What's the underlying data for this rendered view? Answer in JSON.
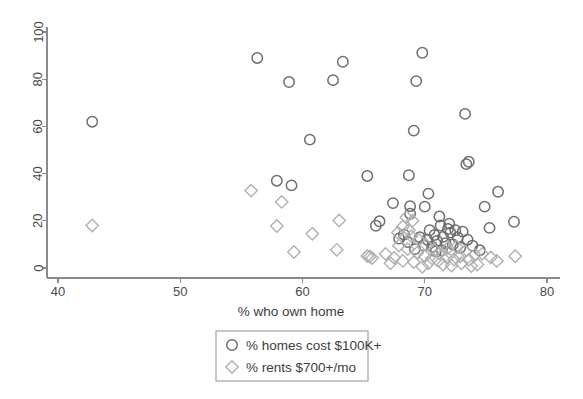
{
  "chart_data": {
    "type": "scatter",
    "title": "",
    "xlabel": "% who own home",
    "ylabel": "",
    "xlim": [
      40,
      80
    ],
    "ylim": [
      0,
      100
    ],
    "xticks": [
      40,
      50,
      60,
      70,
      80
    ],
    "yticks": [
      0,
      20,
      40,
      60,
      80,
      100
    ],
    "grid": false,
    "legend_position": "below-axis-center",
    "series": [
      {
        "name": "% homes cost $100K+",
        "marker": "circle",
        "color": "#6e6e6e",
        "points": [
          [
            42.8,
            62.0
          ],
          [
            56.3,
            89.0
          ],
          [
            58.9,
            78.8
          ],
          [
            62.5,
            79.6
          ],
          [
            63.3,
            87.4
          ],
          [
            69.8,
            91.2
          ],
          [
            69.3,
            79.2
          ],
          [
            73.3,
            65.3
          ],
          [
            69.1,
            58.2
          ],
          [
            60.6,
            54.4
          ],
          [
            73.6,
            45.0
          ],
          [
            73.4,
            44.0
          ],
          [
            65.3,
            39.0
          ],
          [
            68.7,
            39.3
          ],
          [
            57.9,
            37.0
          ],
          [
            59.1,
            35.0
          ],
          [
            70.3,
            31.5
          ],
          [
            76.0,
            32.3
          ],
          [
            67.4,
            27.5
          ],
          [
            68.8,
            26.2
          ],
          [
            70.0,
            26.0
          ],
          [
            68.8,
            23.0
          ],
          [
            74.9,
            26.0
          ],
          [
            66.3,
            19.8
          ],
          [
            66.0,
            17.9
          ],
          [
            77.3,
            19.6
          ],
          [
            71.2,
            21.8
          ],
          [
            75.3,
            17.0
          ],
          [
            71.9,
            16.5
          ],
          [
            72.5,
            16.0
          ],
          [
            72.1,
            15.0
          ],
          [
            73.1,
            15.4
          ],
          [
            70.8,
            14.0
          ],
          [
            71.5,
            13.2
          ],
          [
            72.7,
            13.0
          ],
          [
            69.6,
            13.0
          ],
          [
            70.2,
            12.0
          ],
          [
            71.0,
            11.5
          ],
          [
            68.6,
            11.0
          ],
          [
            71.7,
            10.5
          ],
          [
            72.3,
            10.0
          ],
          [
            69.9,
            9.6
          ],
          [
            70.6,
            9.0
          ],
          [
            73.5,
            12.0
          ],
          [
            68.3,
            14.2
          ],
          [
            69.2,
            8.0
          ],
          [
            71.4,
            7.5
          ],
          [
            72.9,
            8.6
          ],
          [
            70.9,
            7.0
          ],
          [
            74.5,
            7.5
          ],
          [
            73.9,
            9.5
          ],
          [
            67.9,
            12.5
          ],
          [
            70.4,
            16.0
          ],
          [
            72.0,
            18.8
          ],
          [
            71.3,
            18.0
          ]
        ]
      },
      {
        "name": "% rents $700+/mo",
        "marker": "diamond",
        "color": "#b0b0b0",
        "points": [
          [
            42.8,
            18.0
          ],
          [
            55.8,
            32.8
          ],
          [
            58.3,
            28.0
          ],
          [
            57.9,
            17.8
          ],
          [
            59.3,
            6.8
          ],
          [
            60.8,
            14.5
          ],
          [
            62.8,
            7.7
          ],
          [
            63.0,
            20.1
          ],
          [
            65.3,
            5.1
          ],
          [
            65.7,
            4.2
          ],
          [
            65.5,
            4.8
          ],
          [
            67.5,
            4.3
          ],
          [
            68.2,
            3.0
          ],
          [
            68.5,
            21.5
          ],
          [
            69.0,
            20.0
          ],
          [
            68.2,
            17.5
          ],
          [
            68.7,
            16.0
          ],
          [
            67.8,
            15.0
          ],
          [
            68.9,
            13.5
          ],
          [
            69.5,
            12.0
          ],
          [
            67.9,
            9.5
          ],
          [
            68.6,
            8.0
          ],
          [
            69.4,
            6.5
          ],
          [
            70.0,
            5.0
          ],
          [
            70.6,
            4.0
          ],
          [
            69.1,
            2.5
          ],
          [
            70.3,
            2.0
          ],
          [
            71.1,
            3.0
          ],
          [
            71.8,
            4.5
          ],
          [
            72.4,
            3.5
          ],
          [
            72.9,
            5.0
          ],
          [
            71.5,
            1.5
          ],
          [
            72.2,
            1.0
          ],
          [
            73.0,
            2.0
          ],
          [
            73.6,
            3.5
          ],
          [
            74.1,
            5.5
          ],
          [
            73.3,
            7.0
          ],
          [
            74.7,
            6.0
          ],
          [
            75.4,
            4.5
          ],
          [
            75.9,
            3.0
          ],
          [
            77.4,
            5.0
          ],
          [
            70.8,
            7.5
          ],
          [
            71.9,
            8.5
          ],
          [
            72.6,
            9.0
          ],
          [
            73.8,
            0.8
          ],
          [
            74.3,
            1.5
          ],
          [
            66.8,
            6.0
          ],
          [
            69.8,
            0.5
          ],
          [
            67.2,
            2.0
          ],
          [
            71.2,
            6.2
          ],
          [
            72.0,
            6.8
          ],
          [
            70.1,
            9.8
          ]
        ]
      }
    ]
  },
  "legend": {
    "entries": [
      {
        "label": "% homes cost $100K+",
        "marker": "circle"
      },
      {
        "label": "% rents $700+/mo",
        "marker": "diamond"
      }
    ]
  }
}
